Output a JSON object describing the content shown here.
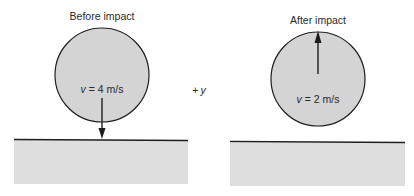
{
  "diagram": {
    "colors": {
      "ball_fill": "#d4d4d4",
      "ground_fill": "#dedede",
      "line": "#1e1e1e",
      "text": "#2a2a2a"
    },
    "before": {
      "label": "Before impact",
      "velocity_symbol": "v",
      "velocity_value": " = 4 m/s",
      "arrow_direction": "down"
    },
    "after": {
      "label": "After impact",
      "velocity_symbol": "v",
      "velocity_value": " = 2 m/s",
      "arrow_direction": "up"
    },
    "axis": {
      "sign": "+",
      "symbol": "y"
    }
  }
}
